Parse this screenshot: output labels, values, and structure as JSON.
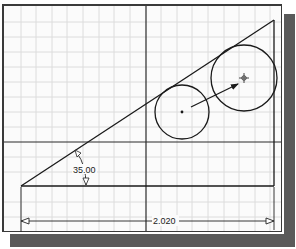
{
  "drawing": {
    "angle_dimension": "35.00",
    "linear_dimension": "2.020"
  },
  "colors": {
    "background": "#fbfbfb",
    "grid": "#dcdcdc",
    "geometry": "#1a1a1a",
    "shadow": "#5a5a5a"
  },
  "geometry": {
    "triangle": {
      "bottom_left": [
        21,
        186
      ],
      "top_right": [
        274,
        20
      ],
      "bottom_right": [
        274,
        186
      ]
    },
    "axis_horizontal_y": 142,
    "axis_vertical_x": 146,
    "circle_small": {
      "cx": 182,
      "cy": 112,
      "r": 27
    },
    "circle_large": {
      "cx": 244,
      "cy": 78,
      "r": 33
    },
    "drag_arrow": {
      "from": [
        191,
        107
      ],
      "to": [
        238,
        84
      ]
    }
  }
}
